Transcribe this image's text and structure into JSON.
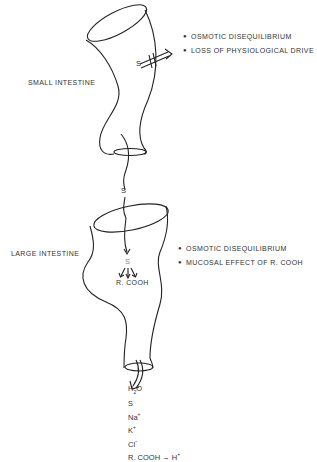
{
  "diagram": {
    "small_intestine": {
      "label": "SMALL INTESTINE",
      "solute_label": "S",
      "effects": [
        "OSMOTIC DISEQUILIBRIUM",
        "LOSS OF PHYSIOLOGICAL DRIVE"
      ]
    },
    "transit": {
      "solute_label": "S"
    },
    "large_intestine": {
      "label": "LARGE INTESTINE",
      "solute_label": "S",
      "product_label": "R. COOH",
      "effects": [
        "OSMOTIC DISEQUILIBRIUM",
        "MUCOSAL EFFECT OF R. COOH"
      ]
    },
    "output": {
      "items": [
        {
          "base": "H",
          "sub": "2",
          "tail": "O",
          "sup": ""
        },
        {
          "base": "S",
          "sub": "",
          "tail": "",
          "sup": ""
        },
        {
          "base": "Na",
          "sub": "",
          "tail": "",
          "sup": "+"
        },
        {
          "base": "K",
          "sub": "",
          "tail": "",
          "sup": "+"
        },
        {
          "base": "Cl",
          "sub": "",
          "tail": "",
          "sup": "−"
        }
      ],
      "final": {
        "left": "R. COOH",
        "arrow": "→",
        "right": "H",
        "right_sup": "+"
      }
    }
  }
}
